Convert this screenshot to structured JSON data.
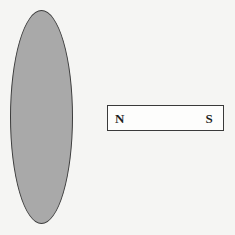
{
  "figure": {
    "canvas": {
      "width": 235,
      "height": 235,
      "background_color": "#f5f5f3"
    },
    "loop": {
      "name": "conducting-loop",
      "shape": "ellipse",
      "fill_color": "#a9a9a9",
      "stroke_color": "#3c3c3c",
      "center_x": 41,
      "center_y": 117,
      "width": 63,
      "height": 214
    },
    "magnet": {
      "name": "bar-magnet",
      "shape": "rectangle",
      "fill_color": "#fdfdfc",
      "stroke_color": "#3a3a3a",
      "x": 107,
      "y": 105,
      "width": 117,
      "height": 26,
      "north_label": "N",
      "south_label": "S"
    }
  }
}
